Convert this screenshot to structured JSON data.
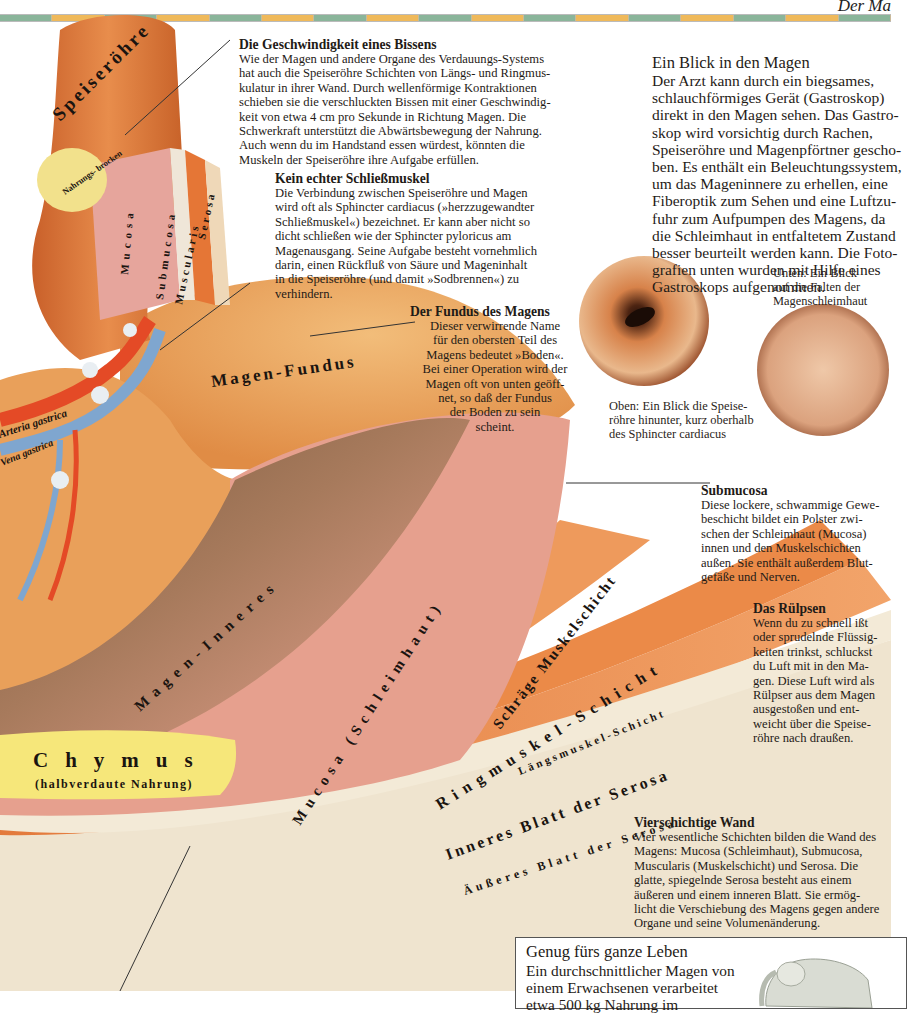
{
  "page": {
    "running_head": "Der Ma",
    "colors": {
      "strip_green": "#8ab59a",
      "strip_orange": "#efb95a",
      "esophagus": "#d87a3c",
      "mucosa_pink": "#e6a08e",
      "muscle_orange": "#e9894b",
      "serosa_cream": "#efe4cf",
      "fundus": "#eba35a",
      "chymus_yellow": "#f6e77a",
      "artery_red": "#e44a26",
      "vein_blue": "#7fa6cf"
    }
  },
  "illustration": {
    "labels": {
      "speiseroehre": "Speiseröhre",
      "nahrungsbrocken": "Nahrungs- brocken",
      "mucosa": "Mucosa",
      "submucosa": "Submucosa",
      "muscularis": "Muscularis",
      "serosa": "Serosa",
      "magen_fundus": "Magen-Fundus",
      "arteria_gastrica": "Arteria gastrica",
      "vena_gastrica": "Vena gastrica",
      "magen_inneres": "Magen-Inneres",
      "mucosa_schleimhaut": "Mucosa (Schleimhaut)",
      "schraege_muskelschicht": "Schräge Muskelschicht",
      "ringmuskel_schicht": "Ringmuskel-Schicht",
      "laengsmuskel_schicht": "Längsmuskel-Schicht",
      "inneres_blatt": "Inneres Blatt der Serosa",
      "aeusseres_blatt": "Äußeres Blatt der Serosa",
      "chymus": "Chymus",
      "chymus_sub": "(halbverdaute Nahrung)"
    }
  },
  "text_blocks": {
    "geschwindigkeit": {
      "heading": "Die Geschwindigkeit eines Bissens",
      "body": "Wie der Magen und andere Organe des Verdauungs-Systems\nhat auch die Speiseröhre Schichten von Längs- und Ringmus-\nkulatur in ihrer Wand. Durch wellenförmige Kontraktionen\nschieben sie die verschluckten Bissen mit einer Geschwindig-\nkeit von etwa 4 cm pro Sekunde in Richtung Magen. Die\nSchwerkraft unterstützt die Abwärtsbewegung der Nahrung.\nAuch wenn du im Handstand essen würdest, könnten die\nMuskeln der Speiseröhre ihre Aufgabe erfüllen."
    },
    "schliessmuskel": {
      "heading": "Kein echter Schließmuskel",
      "body": "Die Verbindung zwischen Speiseröhre und Magen\nwird oft als Sphincter cardiacus (»herzzugewandter\nSchließmuskel«) bezeichnet. Er kann aber nicht so\ndicht schließen wie der Sphincter pyloricus am\nMagenausgang. Seine Aufgabe besteht vornehmlich\ndarin, einen Rückfluß von Säure und Mageninhalt\nin die Speiseröhre (und damit »Sodbrennen«) zu\nverhindern."
    },
    "fundus": {
      "heading": "Der Fundus des Magens",
      "body": "Dieser verwirrende Name\nfür den obersten Teil des\nMagens bedeutet »Boden«.\nBei einer Operation wird der\nMagen oft von unten geöff-\nnet, so daß der Fundus\nder Boden zu sein\nscheint."
    },
    "blick": {
      "heading": "Ein Blick in den Magen",
      "body": "Der Arzt kann durch ein biegsames,\nschlauchförmiges Gerät (Gastroskop)\ndirekt in den Magen sehen. Das Gastro-\nskop wird vorsichtig durch Rachen,\nSpeiseröhre und Magenpförtner gescho-\nben. Es enthält ein Beleuchtungssystem,\num das Mageninnere zu erhellen, eine\nFiberoptik zum Sehen und eine Luftzu-\nfuhr zum Aufpumpen des Magens, da\ndie Schleimhaut in entfaltetem Zustand\nbesser beurteilt werden kann. Die Foto-\ngrafien unten wurden mit Hilfe eines\nGastroskops aufgenommen."
    },
    "submucosa": {
      "heading": "Submucosa",
      "body": "Diese lockere, schwammige Gewe-\nbeschicht bildet ein Polster zwi-\nschen der Schleimhaut (Mucosa)\ninnen und den Muskelschichten\naußen. Sie enthält außerdem Blut-\ngefäße und Nerven."
    },
    "ruelpsen": {
      "heading": "Das Rülpsen",
      "body": "Wenn du zu schnell ißt\noder sprudelnde Flüssig-\nkeiten trinkst, schluckst\ndu Luft mit in den Ma-\ngen. Diese Luft wird als\nRülpser aus dem Magen\nausgestoßen und ent-\nweicht über die Speise-\nröhre nach draußen."
    },
    "wand": {
      "heading": "Vierschichtige Wand",
      "body": "Vier wesentliche Schichten bilden die Wand des\nMagens: Mucosa (Schleimhaut), Submucosa,\nMuscularis (Muskelschicht) und Serosa. Die\nglatte, spiegelnde Serosa besteht aus einem\näußeren und einem inneren Blatt. Sie ermög-\nlicht die Verschiebung des Magens gegen andere\nOrgane und seine Volumenänderung."
    }
  },
  "photos": {
    "oben_caption": "Oben: Ein Blick die Speise-\nröhre hinunter, kurz oberhalb\ndes Sphincter cardiacus",
    "unten_caption": "Unten: Ein Blick\nauf die Falten der\nMagenschleimhaut"
  },
  "box": {
    "title": "Genug fürs ganze Leben",
    "body": "Ein durchschnittlicher Magen von\neinem Erwachsenen verarbeitet\netwa 500 kg Nahrung im"
  }
}
